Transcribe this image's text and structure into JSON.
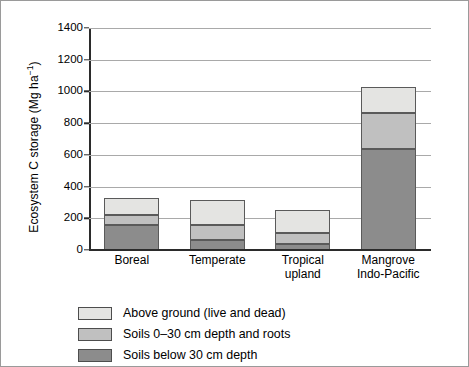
{
  "chart_data": {
    "type": "bar",
    "subtype": "stacked-vertical",
    "title": "",
    "xlabel": "",
    "ylabel": "Ecosystem C storage (Mg ha−1)",
    "ylabel_parts": {
      "text": "Ecosystem C storage (Mg ha",
      "sup": "−1",
      "tail": ")"
    },
    "categories": [
      "Boreal",
      "Temperate",
      "Tropical upland",
      "Mangrove Indo-Pacific"
    ],
    "category_lines": [
      [
        "Boreal"
      ],
      [
        "Temperate"
      ],
      [
        "Tropical",
        "upland"
      ],
      [
        "Mangrove",
        "Indo-Pacific"
      ]
    ],
    "ylim": [
      0,
      1400
    ],
    "yticks": [
      0,
      200,
      400,
      600,
      800,
      1000,
      1200,
      1400
    ],
    "ytick_labels": [
      "0",
      "200",
      "400",
      "600",
      "800",
      "1000",
      "1200",
      "1400"
    ],
    "grid": true,
    "grid_axis": "y",
    "legend_position": "below-plot-left",
    "series": [
      {
        "name": "Soils below 30 cm depth",
        "color": "#8c8c8c",
        "stack_order": 0,
        "values": [
          160,
          65,
          35,
          640
        ]
      },
      {
        "name": "Soils 0–30 cm depth and roots",
        "color": "#c0c0c0",
        "stack_order": 1,
        "values": [
          60,
          95,
          75,
          225
        ]
      },
      {
        "name": "Above ground (live and dead)",
        "color": "#e4e4e2",
        "stack_order": 2,
        "values": [
          105,
          155,
          140,
          165
        ]
      }
    ],
    "totals": [
      325,
      315,
      250,
      1030
    ],
    "legend_display_order": [
      "Above ground (live and dead)",
      "Soils 0–30 cm depth and roots",
      "Soils below 30 cm depth"
    ]
  },
  "legend": {
    "items": [
      {
        "label": "Above ground (live and dead)",
        "swatch": "c2"
      },
      {
        "label": "Soils 0–30 cm depth and roots",
        "swatch": "c1"
      },
      {
        "label": "Soils below 30 cm depth",
        "swatch": "c0"
      }
    ]
  },
  "colors": {
    "above_ground": "#e4e4e2",
    "soils_shallow": "#c0c0c0",
    "soils_deep": "#8c8c8c",
    "gridline": "#a9a9a9",
    "axis": "#2b2b2b",
    "frame": "#9a9a9a",
    "background": "#ffffff"
  }
}
